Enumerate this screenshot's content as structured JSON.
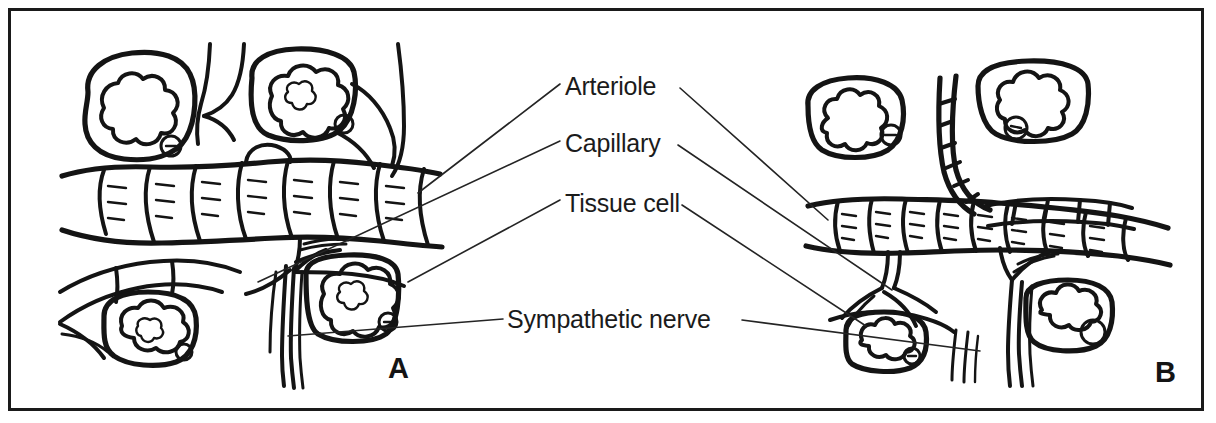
{
  "figure": {
    "kind": "hand-drawn-line-diagram",
    "background_color": "#ffffff",
    "ink_color": "#141414",
    "frame": {
      "border_color": "#1a1a1a",
      "border_width_px": 3
    }
  },
  "labels": [
    {
      "id": "arteriole",
      "text": "Arteriole"
    },
    {
      "id": "capillary",
      "text": "Capillary"
    },
    {
      "id": "tissue_cell",
      "text": "Tissue cell"
    },
    {
      "id": "sympathetic_nerve",
      "text": "Sympathetic nerve"
    }
  ],
  "panels": [
    {
      "id": "a",
      "letter": "A"
    },
    {
      "id": "b",
      "letter": "B"
    }
  ],
  "leader_lines": {
    "count": 7,
    "color": "#242424",
    "stroke_width_px": 1.6
  },
  "drawing_elements": {
    "arteriole": {
      "description": "Horizontal tube with segmented smooth-muscle rings and short tick marks",
      "panel_a_state": "dilated / wide lumen",
      "panel_b_state": "constricted / narrow lumen"
    },
    "capillary": {
      "description": "Thin branching vessels descending from the arteriole"
    },
    "tissue_cell": {
      "description": "Rounded-rectangle cell outline containing a lobed star-shaped nucleus and a small round nucleolus"
    },
    "sympathetic_nerve": {
      "description": "Fine vertical nerve fibres running down across the vessels"
    }
  }
}
